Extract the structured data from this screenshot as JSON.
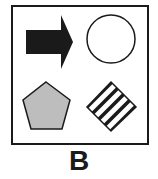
{
  "figure": {
    "label": "B",
    "shapes": [
      {
        "position": "top-left",
        "shape": "arrow-right",
        "fill": "#1a1a1a"
      },
      {
        "position": "top-right",
        "shape": "circle",
        "fill": "#ffffff"
      },
      {
        "position": "bottom-left",
        "shape": "pentagon",
        "fill": "#bdbdbd"
      },
      {
        "position": "bottom-right",
        "shape": "diamond-striped",
        "fill": "#1a1a1a"
      }
    ]
  }
}
